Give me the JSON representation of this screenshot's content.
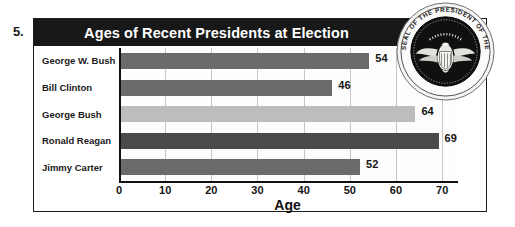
{
  "question_number": "5.",
  "chart_data": {
    "type": "bar",
    "orientation": "horizontal",
    "title": "Ages of Recent Presidents at Election",
    "xlabel": "Age",
    "ylabel": "",
    "categories": [
      "George W. Bush",
      "Bill Clinton",
      "George Bush",
      "Ronald Reagan",
      "Jimmy Carter"
    ],
    "values": [
      54,
      46,
      64,
      69,
      52
    ],
    "bar_colors": [
      "#6b6b6b",
      "#6b6b6b",
      "#bdbdbd",
      "#4a4a4a",
      "#6b6b6b"
    ],
    "xlim": [
      0,
      73
    ],
    "xticks": [
      0,
      10,
      20,
      30,
      40,
      50,
      60,
      70
    ],
    "xtick_labels": [
      "0",
      "10",
      "20",
      "30",
      "40",
      "50",
      "60",
      "70"
    ],
    "grid": true,
    "grid_axis": "x",
    "legend": false,
    "title_banner_color": "#181818",
    "title_text_color": "#ffffff"
  },
  "seal": {
    "name": "presidential-seal",
    "text_top": "SEAL OF THE PRESIDENT OF THE",
    "text_bottom": "UNITED STATES"
  }
}
